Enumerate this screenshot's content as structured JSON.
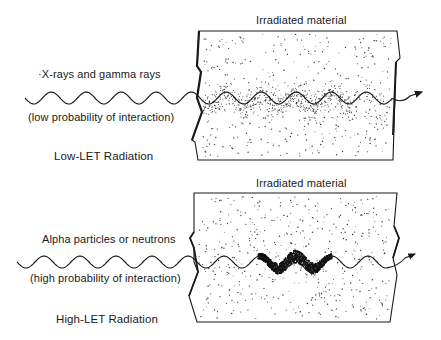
{
  "figure": {
    "panels": [
      {
        "id": "low-let",
        "material_label": "Irradiated material",
        "radiation_label": "·X-rays and gamma rays",
        "probability_label": "(low probability of interaction)",
        "title": "Low-LET Radiation",
        "interaction_density": "sparse"
      },
      {
        "id": "high-let",
        "material_label": "Irradiated material",
        "radiation_label": "Alpha particles or neutrons",
        "probability_label": "(high probability of interaction)",
        "title": "High-LET Radiation",
        "interaction_density": "dense"
      }
    ],
    "colors": {
      "ink": "#1a1a1a",
      "stipple": "#3a3a3a",
      "background": "#ffffff"
    }
  }
}
